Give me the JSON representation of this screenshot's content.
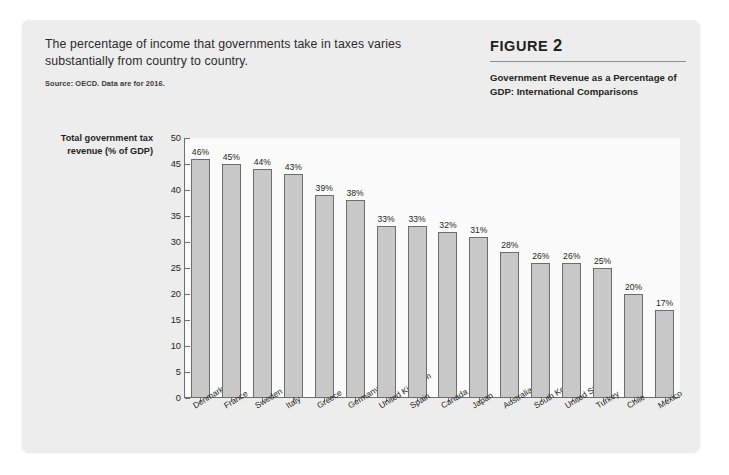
{
  "card": {
    "intro_text": "The percentage of income that governments take in taxes varies substantially from country to country.",
    "source_note": "Source: OECD. Data are for 2016."
  },
  "figure": {
    "label_word": "FIGURE",
    "number": "2",
    "subtitle": "Government Revenue as a Percentage of GDP: International Comparisons"
  },
  "chart_data": {
    "type": "bar",
    "title": "Government Revenue as a Percentage of GDP: International Comparisons",
    "xlabel": "",
    "ylabel": "Total government tax revenue (% of GDP)",
    "ylim": [
      0,
      50
    ],
    "yticks": [
      "0",
      "5",
      "10",
      "15",
      "20",
      "25",
      "30",
      "35",
      "40",
      "45",
      "50"
    ],
    "grid": false,
    "legend": "none",
    "categories": [
      "Denmark",
      "France",
      "Sweden",
      "Italy",
      "Greece",
      "Germany",
      "United Kingdom",
      "Spain",
      "Canada",
      "Japan",
      "Australia",
      "South Korea",
      "United States",
      "Turkey",
      "Chile",
      "Mexico"
    ],
    "values": [
      46,
      45,
      44,
      43,
      39,
      38,
      33,
      33,
      32,
      31,
      28,
      26,
      26,
      25,
      20,
      17
    ],
    "data_labels": [
      "46%",
      "45%",
      "44%",
      "43%",
      "39%",
      "38%",
      "33%",
      "33%",
      "32%",
      "31%",
      "28%",
      "26%",
      "26%",
      "25%",
      "20%",
      "17%"
    ],
    "bar_color": "#c8c8c8",
    "bar_edge_color": "#6d6d6d",
    "axis_color": "#6f6f6f",
    "plot_background": "#fbfbfb",
    "card_background": "#ededed"
  }
}
